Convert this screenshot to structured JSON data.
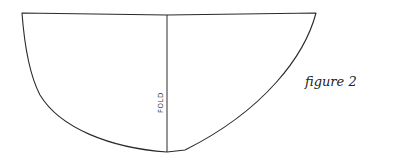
{
  "diagram": {
    "type": "sewing-pattern-piece",
    "shape": "half-ellipse",
    "fold_label": "FOLD",
    "caption": "figure 2",
    "stroke_color": "#2a2a2a",
    "background": "#ffffff"
  }
}
